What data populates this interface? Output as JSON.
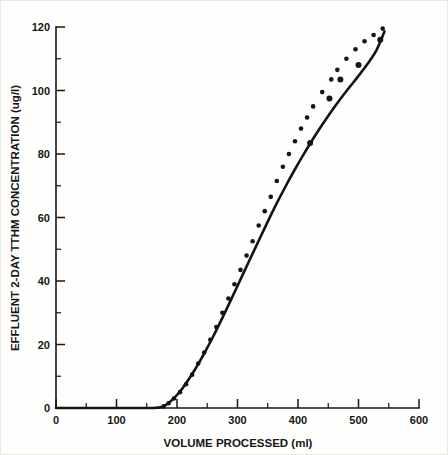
{
  "chart_data": {
    "type": "scatter",
    "title": "",
    "subtitle": "",
    "xlabel": "VOLUME PROCESSED (ml)",
    "ylabel": "EFFLUENT 2-DAY TTHM CONCENTRATION (ug/l)",
    "xlim": [
      0,
      600
    ],
    "ylim": [
      0,
      120
    ],
    "xticks": [
      0,
      100,
      200,
      300,
      400,
      500,
      600
    ],
    "xtick_labels": [
      "0",
      "100",
      "200",
      "300",
      "400",
      "500",
      "600"
    ],
    "yticks": [
      0,
      20,
      40,
      60,
      80,
      100,
      120
    ],
    "ytick_labels": [
      "0",
      "20",
      "40",
      "60",
      "80",
      "100",
      "120"
    ],
    "x_minor_tick_interval": 50,
    "y_minor_tick_interval": 10,
    "grid": false,
    "legend": null,
    "legend_position": "none",
    "annotations": [],
    "series": [
      {
        "name": "Effluent 2-day TTHM concentration",
        "marker": "filled-circle",
        "marker_color": "#141414",
        "line_color": "#141414",
        "x": [
          178,
          186,
          195,
          205,
          215,
          225,
          235,
          245,
          255,
          265,
          275,
          285,
          295,
          305,
          315,
          325,
          335,
          345,
          355,
          365,
          375,
          385,
          395,
          405,
          415,
          425,
          440,
          455,
          465,
          480,
          495,
          510,
          525,
          540
        ],
        "y": [
          0.5,
          1.5,
          3.0,
          5.0,
          7.5,
          10.5,
          14.0,
          17.5,
          21.5,
          25.5,
          30.0,
          34.5,
          39.0,
          43.5,
          48.0,
          52.5,
          57.5,
          62.0,
          66.5,
          71.5,
          76.0,
          80.0,
          84.0,
          88.0,
          91.5,
          95.0,
          99.5,
          103.5,
          106.5,
          110.0,
          113.0,
          115.5,
          117.5,
          119.5
        ]
      },
      {
        "name": "Scattered replicate points",
        "marker": "filled-circle",
        "marker_color": "#141414",
        "x": [
          420,
          452,
          470,
          500,
          536
        ],
        "y": [
          83.5,
          97.5,
          103.5,
          108.0,
          116.0
        ]
      }
    ],
    "fitted_curve": {
      "name": "Fitted sigmoid breakthrough curve",
      "color": "#141414",
      "x": [
        0,
        60,
        120,
        160,
        175,
        185,
        195,
        205,
        215,
        230,
        245,
        260,
        275,
        290,
        305,
        320,
        335,
        350,
        365,
        380,
        395,
        410,
        425,
        440,
        455,
        470,
        485,
        500,
        515,
        530,
        543
      ],
      "y": [
        0,
        0,
        0,
        0,
        0.3,
        1.4,
        3.1,
        5.2,
        7.8,
        12.2,
        17.2,
        22.6,
        28.4,
        34.4,
        40.5,
        46.6,
        52.7,
        58.7,
        64.5,
        70.0,
        75.2,
        80.1,
        84.8,
        89.2,
        93.4,
        97.3,
        101.0,
        104.6,
        108.4,
        112.8,
        118.6
      ]
    }
  },
  "axes": {
    "x_axis_name": "volume-processed-axis",
    "y_axis_name": "tthm-concentration-axis"
  }
}
